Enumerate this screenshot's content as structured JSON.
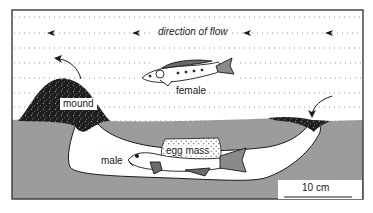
{
  "diagram": {
    "labels": {
      "flow": "direction of flow",
      "female": "female",
      "male": "male",
      "mound": "mound",
      "egg_mass": "egg mass",
      "scale": "10 cm"
    },
    "colors": {
      "water": "#ffffff",
      "ground": "#9a9a9a",
      "burrow": "#ffffff",
      "frame": "#3a3a3a",
      "ink": "#1a1a1a",
      "gravel": "#222222",
      "flow_dots": "#8c8c8c"
    },
    "icons": {
      "flow_arrow": "arrowhead-left-icon",
      "curved_arrow": "curved-arrow-icon"
    }
  }
}
